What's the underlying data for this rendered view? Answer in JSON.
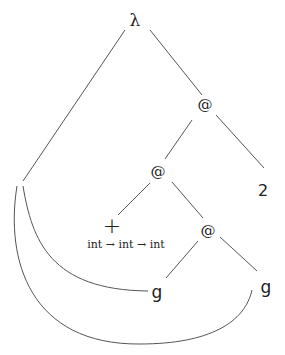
{
  "diagram": {
    "type": "abstract-syntax-tree",
    "nodes": {
      "lambda": {
        "label": "λ",
        "x": 135,
        "y": 20
      },
      "app1": {
        "label": "@",
        "x": 205,
        "y": 104
      },
      "app2": {
        "label": "@",
        "x": 158,
        "y": 171
      },
      "two": {
        "label": "2",
        "x": 263,
        "y": 190
      },
      "plus": {
        "label": "+",
        "x": 112,
        "y": 225
      },
      "plus_type": {
        "label": "int → int → int",
        "x": 126,
        "y": 244
      },
      "app3": {
        "label": "@",
        "x": 208,
        "y": 230
      },
      "g_left": {
        "label": "g",
        "x": 157,
        "y": 292
      },
      "g_right": {
        "label": "g",
        "x": 266,
        "y": 287
      }
    },
    "edges": [
      {
        "from": "lambda",
        "to": "binder"
      },
      {
        "from": "lambda",
        "to": "app1"
      },
      {
        "from": "app1",
        "to": "app2"
      },
      {
        "from": "app1",
        "to": "two"
      },
      {
        "from": "app2",
        "to": "plus"
      },
      {
        "from": "app2",
        "to": "app3"
      },
      {
        "from": "app3",
        "to": "g_left"
      },
      {
        "from": "app3",
        "to": "g_right"
      },
      {
        "from": "binder",
        "to": "g_left",
        "kind": "binding-curve"
      },
      {
        "from": "binder",
        "to": "g_right",
        "kind": "binding-curve"
      }
    ],
    "line_color": "#555555"
  }
}
